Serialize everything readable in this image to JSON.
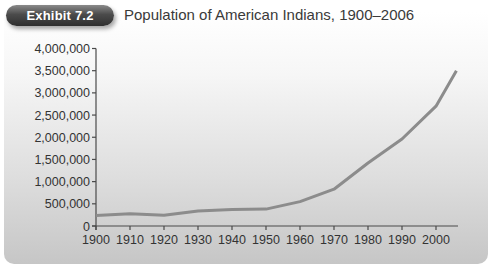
{
  "exhibit": {
    "label": "Exhibit 7.2",
    "title": "Population of American Indians, 1900–2006"
  },
  "colors": {
    "line": "#8c8c8c",
    "axis": "#4a4a4a",
    "badge": "#3c3c3c"
  },
  "chart_data": {
    "type": "line",
    "title": "Population of American Indians, 1900–2006",
    "xlabel": "",
    "ylabel": "",
    "x": [
      1900,
      1910,
      1920,
      1930,
      1940,
      1950,
      1960,
      1970,
      1980,
      1990,
      2000,
      2006
    ],
    "series": [
      {
        "name": "American Indian population",
        "values": [
          237000,
          277000,
          244000,
          340000,
          370000,
          380000,
          550000,
          830000,
          1420000,
          1960000,
          2700000,
          3500000
        ]
      }
    ],
    "x_ticks": [
      "1900",
      "1910",
      "1920",
      "1930",
      "1940",
      "1950",
      "1960",
      "1970",
      "1980",
      "1990",
      "2000"
    ],
    "y_ticks": [
      "0",
      "500,000",
      "1,000,000",
      "1,500,000",
      "2,000,000",
      "2,500,000",
      "3,000,000",
      "3,500,000",
      "4,000,000"
    ],
    "ylim": [
      0,
      4000000
    ],
    "xlim": [
      1900,
      2006
    ],
    "grid": false,
    "legend": null
  }
}
